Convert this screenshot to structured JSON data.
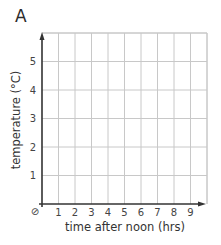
{
  "panel_label": "A",
  "chart_data": {
    "type": "line",
    "title": "",
    "xlabel": "time after noon (hrs)",
    "ylabel": "temperature (°C)",
    "x_ticks": [
      "1",
      "2",
      "3",
      "4",
      "5",
      "6",
      "7",
      "8",
      "9"
    ],
    "y_ticks": [
      "1",
      "2",
      "3",
      "4",
      "5"
    ],
    "origin_symbol": "⊘",
    "xlim": [
      0,
      10
    ],
    "ylim": [
      0,
      6
    ],
    "grid": true,
    "series": [],
    "legend": null
  },
  "colors": {
    "grid": "#c8c8c8",
    "axis": "#333333",
    "text": "#444444"
  }
}
